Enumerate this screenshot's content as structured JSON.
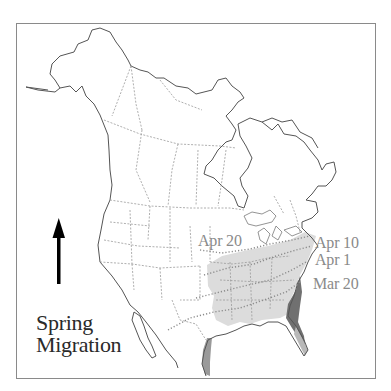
{
  "map": {
    "title_line1": "Spring",
    "title_line2": "Migration",
    "direction_arrow": "arrow-up-icon",
    "isochrone_labels": [
      {
        "label": "Apr 20"
      },
      {
        "label": "Apr 10"
      },
      {
        "label": "Apr 1"
      },
      {
        "label": "Mar 20"
      }
    ],
    "colors": {
      "coastline": "#555555",
      "borders": "#9a9a9a",
      "migration_range": "#dcdcdc",
      "wintering_range": "#6e6e6e",
      "label_text": "#8a8a8a",
      "title_text": "#2a2a2a",
      "frame": "#8a8a8a"
    }
  }
}
